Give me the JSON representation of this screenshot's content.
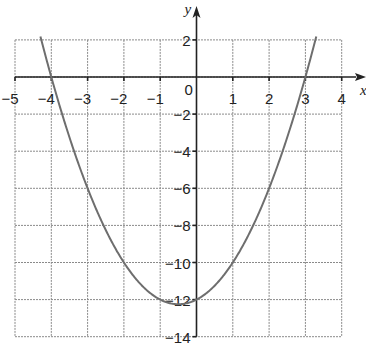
{
  "chart_data": {
    "type": "line",
    "title": "",
    "xlabel": "x",
    "ylabel": "y",
    "xlim": [
      -5,
      4
    ],
    "ylim": [
      -14,
      2
    ],
    "grid": true,
    "x_ticks": [
      -5,
      -4,
      -3,
      -2,
      -1,
      1,
      2,
      3,
      4
    ],
    "y_ticks": [
      2,
      -2,
      -4,
      -6,
      -8,
      -10,
      -12,
      -14
    ],
    "origin_label": "0",
    "series": [
      {
        "name": "y = x^2 + x - 12",
        "equation": "y = (x + 4)(x - 3)",
        "x": [
          -4.3,
          -4,
          -3.5,
          -3,
          -2.5,
          -2,
          -1.5,
          -1,
          -0.5,
          0,
          0.5,
          1,
          1.5,
          2,
          2.5,
          3,
          3.3
        ],
        "y": [
          2.19,
          0,
          -3.25,
          -6,
          -8.25,
          -10,
          -11.25,
          -12,
          -12.25,
          -12,
          -11.25,
          -10,
          -8.25,
          -6,
          -3.25,
          0,
          2.19
        ],
        "color": "#6e6e6e"
      }
    ],
    "annotations": {
      "roots": [
        -4,
        3
      ],
      "y_intercept": -12,
      "vertex": [
        -0.5,
        -12.25
      ]
    }
  },
  "labels": {
    "x_axis": "x",
    "y_axis": "y",
    "origin": "0",
    "x_tick_texts": [
      "−5",
      "−4",
      "−3",
      "−2",
      "−1",
      "1",
      "2",
      "3",
      "4"
    ],
    "y_tick_texts": [
      "2",
      "−2",
      "−4",
      "−6",
      "−8",
      "−10",
      "−12",
      "−14"
    ]
  }
}
